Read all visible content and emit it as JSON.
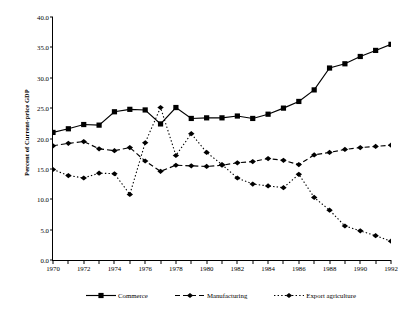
{
  "chart_data": {
    "type": "line",
    "title": "",
    "xlabel": "",
    "ylabel": "Percent of Current-price GDP",
    "xlim": [
      1970,
      1992
    ],
    "ylim": [
      0.0,
      40.0
    ],
    "yticks": [
      "0.0",
      "5.0",
      "10.0",
      "15.0",
      "20.0",
      "25.0",
      "30.0",
      "35.0",
      "40.0"
    ],
    "ytick_values": [
      0,
      5,
      10,
      15,
      20,
      25,
      30,
      35,
      40
    ],
    "xticks": [
      "1970",
      "1972",
      "1974",
      "1976",
      "1978",
      "1980",
      "1982",
      "1984",
      "1986",
      "1988",
      "1990",
      "1992"
    ],
    "xtick_values": [
      1970,
      1972,
      1974,
      1976,
      1978,
      1980,
      1982,
      1984,
      1986,
      1988,
      1990,
      1992
    ],
    "x": [
      1970,
      1971,
      1972,
      1973,
      1974,
      1975,
      1976,
      1977,
      1978,
      1979,
      1980,
      1981,
      1982,
      1983,
      1984,
      1985,
      1986,
      1987,
      1988,
      1989,
      1990,
      1991,
      1992
    ],
    "grid": false,
    "legend_position": "bottom",
    "series": [
      {
        "name": "Commerce",
        "line_style": "solid",
        "marker": "square",
        "color": "#000000",
        "values": [
          21.0,
          21.6,
          22.3,
          22.2,
          24.4,
          24.8,
          24.7,
          22.4,
          25.1,
          23.3,
          23.4,
          23.4,
          23.7,
          23.3,
          24.0,
          25.0,
          26.1,
          28.0,
          31.6,
          32.3,
          33.5,
          34.5,
          35.5
        ]
      },
      {
        "name": "Manufacturing",
        "line_style": "dashed",
        "marker": "diamond",
        "color": "#000000",
        "values": [
          18.8,
          19.2,
          19.5,
          18.3,
          18.0,
          18.5,
          16.3,
          14.6,
          15.6,
          15.5,
          15.4,
          15.6,
          16.0,
          16.2,
          16.7,
          16.4,
          15.7,
          17.3,
          17.7,
          18.2,
          18.5,
          18.7,
          18.9
        ]
      },
      {
        "name": "Export agriculture",
        "line_style": "dotted",
        "marker": "diamond",
        "color": "#000000",
        "values": [
          14.9,
          13.9,
          13.5,
          14.3,
          14.2,
          10.8,
          19.3,
          25.1,
          17.2,
          20.8,
          17.7,
          15.7,
          13.5,
          12.5,
          12.2,
          11.9,
          14.1,
          10.3,
          8.2,
          5.6,
          4.8,
          4.0,
          3.1
        ]
      }
    ]
  },
  "legend": {
    "items": [
      {
        "label": "Commerce"
      },
      {
        "label": "Manufacturing"
      },
      {
        "label": "Export agriculture"
      }
    ]
  }
}
